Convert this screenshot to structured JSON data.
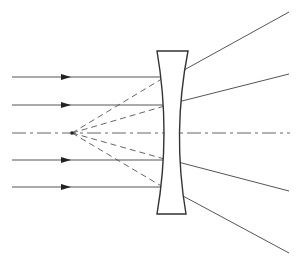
{
  "diagram": {
    "colors": {
      "background": "#ffffff",
      "ray": "#555555",
      "lens_outline": "#333333",
      "arrowhead": "#222222"
    },
    "optical_axis": {
      "y": 133,
      "x_start": 12,
      "x_end": 290,
      "style": "dash-dot"
    },
    "lens": {
      "type": "biconcave",
      "top_y": 51,
      "bottom_y": 214,
      "top_left_x": 157,
      "top_right_x": 188,
      "bottom_left_x": 157,
      "bottom_right_x": 186,
      "waist_left_x": 167,
      "waist_right_x": 176
    },
    "virtual_focus": {
      "x": 72,
      "y": 133
    },
    "incident_rays": [
      {
        "y": 77,
        "x_start": 12,
        "x_end": 163,
        "arrow_x": 66
      },
      {
        "y": 105,
        "x_start": 12,
        "x_end": 167,
        "arrow_x": 66
      },
      {
        "y": 160,
        "x_start": 12,
        "x_end": 167,
        "arrow_x": 66
      },
      {
        "y": 187,
        "x_start": 12,
        "x_end": 163,
        "arrow_x": 66
      }
    ],
    "refracted_rays": [
      {
        "x1": 184,
        "y1": 70,
        "x2": 289,
        "y2": 12
      },
      {
        "x1": 178,
        "y1": 102,
        "x2": 289,
        "y2": 74
      },
      {
        "x1": 178,
        "y1": 162,
        "x2": 289,
        "y2": 191
      },
      {
        "x1": 183,
        "y1": 196,
        "x2": 289,
        "y2": 253
      }
    ],
    "virtual_extensions": [
      {
        "x1": 72,
        "y1": 133,
        "x2": 165,
        "y2": 77
      },
      {
        "x1": 72,
        "y1": 133,
        "x2": 168,
        "y2": 105
      },
      {
        "x1": 72,
        "y1": 133,
        "x2": 168,
        "y2": 160
      },
      {
        "x1": 72,
        "y1": 133,
        "x2": 163,
        "y2": 187
      }
    ]
  }
}
